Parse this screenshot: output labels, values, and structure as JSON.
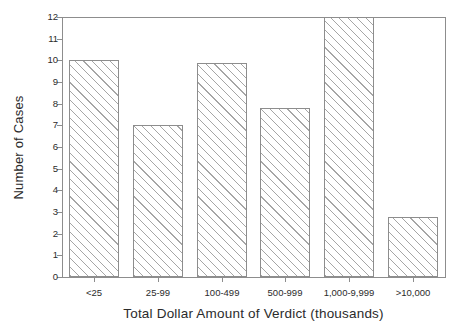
{
  "chart_data": {
    "type": "bar",
    "title": "",
    "xlabel": "Total Dollar Amount of Verdict (thousands)",
    "ylabel": "Number of Cases",
    "categories": [
      "<25",
      "25-99",
      "100-499",
      "500-999",
      "1,000-9,999",
      ">10,000"
    ],
    "values": [
      10,
      7,
      9.9,
      7.8,
      12,
      2.75
    ],
    "ylim": [
      0,
      12
    ],
    "yticks": [
      0,
      1,
      2,
      3,
      4,
      5,
      6,
      7,
      8,
      9,
      10,
      11,
      12
    ],
    "ytick_labels": [
      "0",
      "1",
      "2",
      "3",
      "4",
      "5",
      "6",
      "7",
      "8",
      "9",
      "10",
      "11",
      "12"
    ],
    "grid": false,
    "legend": "none",
    "bar_fill": "diagonal-hatch",
    "bar_edge_color": "#8d8d8d",
    "axis_color": "#8d8d8d",
    "background": "#ffffff"
  },
  "figure": {
    "cropped_title_text": ""
  }
}
